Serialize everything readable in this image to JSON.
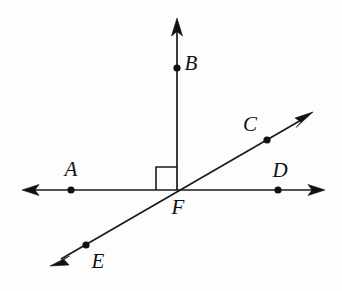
{
  "figure": {
    "background_color": "#fdfdfd",
    "ink_color": "#111111",
    "labels": {
      "a": "A",
      "b": "B",
      "c": "C",
      "d": "D",
      "e": "E",
      "f": "F"
    },
    "points": [
      {
        "name": "A",
        "label": "A",
        "x": 71,
        "y": 190,
        "label_x": 71,
        "label_y": 171
      },
      {
        "name": "B",
        "label": "B",
        "x": 177,
        "y": 68,
        "label_x": 191,
        "label_y": 65
      },
      {
        "name": "C",
        "label": "C",
        "x": 267,
        "y": 140,
        "label_x": 250,
        "label_y": 126
      },
      {
        "name": "D",
        "label": "D",
        "x": 278,
        "y": 190,
        "label_x": 280,
        "label_y": 172
      },
      {
        "name": "E",
        "label": "E",
        "x": 86,
        "y": 245,
        "label_x": 98,
        "label_y": 263
      },
      {
        "name": "F",
        "label": "F",
        "x": 177,
        "y": 190,
        "label_x": 178,
        "label_y": 209
      }
    ],
    "segments": [
      {
        "name": "horizontal-line-AD",
        "through": "A, F, D",
        "x1": 26,
        "y1": 190,
        "x2": 321,
        "y2": 190,
        "arrows": "both"
      },
      {
        "name": "diagonal-line-EC",
        "through": "E, F, C",
        "x1": 56,
        "y1": 262,
        "x2": 308,
        "y2": 116,
        "arrows": "both"
      },
      {
        "name": "vertical-ray-FB",
        "through": "F, B",
        "x1": 177,
        "y1": 190,
        "x2": 177,
        "y2": 24,
        "arrows": "end"
      }
    ],
    "right_angle": {
      "name": "right-angle-marker",
      "at_point": "F",
      "between": "ray FB and ray FA",
      "x": 156,
      "y": 166,
      "size": 21
    }
  }
}
